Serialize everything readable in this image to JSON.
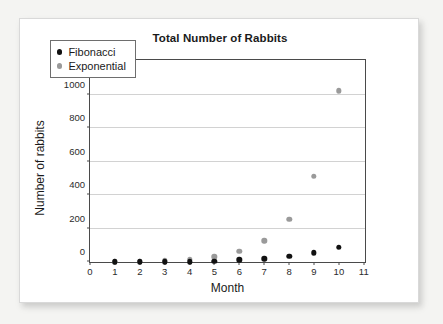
{
  "chart_data": {
    "type": "scatter",
    "title": "Total Number of Rabbits",
    "xlabel": "Month",
    "ylabel": "Number of rabbits",
    "xlim": [
      0,
      11
    ],
    "ylim": [
      0,
      1200
    ],
    "xticks": [
      0,
      1,
      2,
      3,
      4,
      5,
      6,
      7,
      8,
      9,
      10,
      11
    ],
    "yticks": [
      0,
      200,
      400,
      600,
      800,
      1000,
      1200
    ],
    "grid": "horizontal",
    "legend_position": "upper-left-inside",
    "x": [
      1,
      2,
      3,
      4,
      5,
      6,
      7,
      8,
      9,
      10
    ],
    "series": [
      {
        "name": "Fibonacci",
        "color": "#111111",
        "values": [
          1,
          1,
          2,
          3,
          5,
          13,
          21,
          34,
          55,
          89
        ]
      },
      {
        "name": "Exponential",
        "color": "#9a9a9a",
        "values": [
          2,
          4,
          8,
          16,
          32,
          64,
          128,
          256,
          512,
          1024
        ]
      }
    ]
  },
  "legend": {
    "items": [
      {
        "label": "Fibonacci",
        "marker": "dot-black"
      },
      {
        "label": "Exponential",
        "marker": "dot-gray"
      }
    ]
  }
}
